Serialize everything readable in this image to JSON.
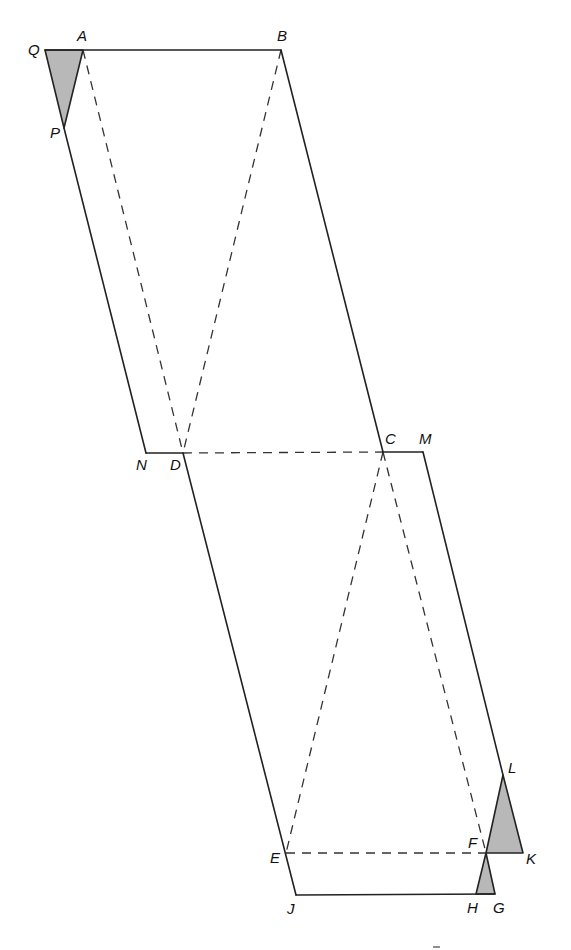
{
  "diagram": {
    "points": {
      "Q": {
        "x": 45,
        "y": 50,
        "label": "Q",
        "lx": 28,
        "ly": 55
      },
      "A": {
        "x": 83,
        "y": 50,
        "label": "A",
        "lx": 77,
        "ly": 41
      },
      "B": {
        "x": 281,
        "y": 50,
        "label": "B",
        "lx": 277,
        "ly": 41
      },
      "P": {
        "x": 64,
        "y": 128,
        "label": "P",
        "lx": 50,
        "ly": 138
      },
      "N": {
        "x": 146,
        "y": 453,
        "label": "N",
        "lx": 136,
        "ly": 470
      },
      "D": {
        "x": 183,
        "y": 453,
        "label": "D",
        "lx": 170,
        "ly": 470
      },
      "C": {
        "x": 383,
        "y": 452,
        "label": "C",
        "lx": 385,
        "ly": 444
      },
      "M": {
        "x": 423,
        "y": 452,
        "label": "M",
        "lx": 419,
        "ly": 444
      },
      "E": {
        "x": 286,
        "y": 853,
        "label": "E",
        "lx": 270,
        "ly": 863
      },
      "J": {
        "x": 296,
        "y": 895,
        "label": "J",
        "lx": 287,
        "ly": 914
      },
      "L": {
        "x": 503,
        "y": 775,
        "label": "L",
        "lx": 508,
        "ly": 773
      },
      "F": {
        "x": 486,
        "y": 853,
        "label": "F",
        "lx": 468,
        "ly": 848
      },
      "K": {
        "x": 523,
        "y": 853,
        "label": "K",
        "lx": 526,
        "ly": 864
      },
      "H": {
        "x": 476,
        "y": 894,
        "label": "H",
        "lx": 467,
        "ly": 913
      },
      "G": {
        "x": 495,
        "y": 894,
        "label": "G",
        "lx": 493,
        "ly": 913
      }
    },
    "solid_segments": [
      [
        "Q",
        "B"
      ],
      [
        "P",
        "N"
      ],
      [
        "N",
        "D"
      ],
      [
        "B",
        "C"
      ],
      [
        "C",
        "M"
      ],
      [
        "M",
        "L"
      ],
      [
        "D",
        "J"
      ],
      [
        "J",
        "G"
      ]
    ],
    "dashed_segments": [
      [
        "A",
        "D"
      ],
      [
        "B",
        "D"
      ],
      [
        "D",
        "C"
      ],
      [
        "C",
        "E"
      ],
      [
        "C",
        "F"
      ],
      [
        "E",
        "F"
      ]
    ],
    "shaded_triangles": [
      [
        "Q",
        "A",
        "P"
      ],
      [
        "F",
        "L",
        "K"
      ],
      [
        "F",
        "H",
        "G"
      ]
    ],
    "colors": {
      "line": "#222222",
      "shade": "#b8b8b8",
      "background": "#ffffff"
    }
  }
}
